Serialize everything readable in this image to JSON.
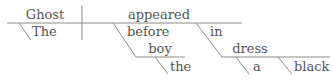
{
  "diagram": {
    "type": "sentence-diagram",
    "sentence": "The ghost appeared before the boy in a black dress",
    "words": {
      "subject": "Ghost",
      "subject_modifier": "The",
      "verb": "appeared",
      "preposition_1": "before",
      "object_1": "boy",
      "object_1_modifier": "the",
      "preposition_2": "in",
      "object_2": "dress",
      "object_2_modifier_1": "a",
      "object_2_modifier_2": "black"
    },
    "colors": {
      "text": "#555555",
      "lines": "#8a8a8a",
      "background": "#ffffff"
    }
  }
}
